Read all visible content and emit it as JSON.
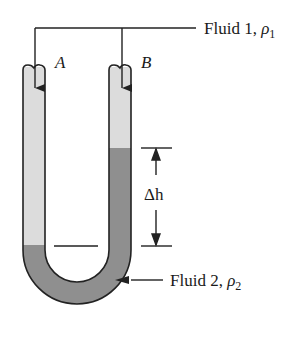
{
  "diagram": {
    "type": "U-tube manometer",
    "labels": {
      "fluid1": "Fluid 1, ",
      "fluid1_symbol": "ρ",
      "fluid1_sub": "1",
      "fluid2": "Fluid 2, ",
      "fluid2_symbol": "ρ",
      "fluid2_sub": "2",
      "point_a": "A",
      "point_b": "B",
      "delta_h": "Δh"
    },
    "colors": {
      "fluid1": "#dcdcdc",
      "fluid2": "#8f8f8f",
      "outline": "#222222"
    }
  }
}
